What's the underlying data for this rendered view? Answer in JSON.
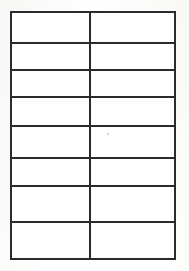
{
  "document": {
    "kind": "scanned-blank-table",
    "page_width": 189,
    "page_height": 271,
    "background_color": "#ffffff",
    "paper_tint_color": "#f6f6f4",
    "title": ""
  },
  "table": {
    "name": "blank-two-column-table",
    "row_count": 8,
    "column_count": 2,
    "border_color": "#2b2b2b",
    "border_width_px": 2,
    "outer_border_width_px": 2,
    "cell_fill_color": "#ffffff",
    "bounds": {
      "left": 10,
      "top": 11,
      "right": 176,
      "bottom": 260
    },
    "column_divider_x": 91,
    "row_boundaries_y": [
      11,
      44,
      71,
      98,
      127,
      160,
      188,
      224,
      259
    ],
    "column_widths_px": [
      81,
      85
    ],
    "row_heights_px": [
      33,
      27,
      27,
      29,
      33,
      28,
      36,
      35
    ],
    "headers": [
      "",
      ""
    ],
    "rows": [
      {
        "cells": [
          "",
          ""
        ]
      },
      {
        "cells": [
          "",
          ""
        ]
      },
      {
        "cells": [
          "",
          ""
        ]
      },
      {
        "cells": [
          "",
          ""
        ]
      },
      {
        "cells": [
          "",
          ""
        ]
      },
      {
        "cells": [
          "",
          ""
        ]
      },
      {
        "cells": [
          "",
          ""
        ]
      },
      {
        "cells": [
          "",
          ""
        ]
      }
    ]
  },
  "artifacts": {
    "specks": [
      {
        "x": 107,
        "y": 133,
        "size": 2,
        "color": "#c9c9c4"
      }
    ]
  }
}
